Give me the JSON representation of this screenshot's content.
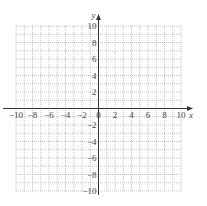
{
  "chart_data": {
    "type": "scatter",
    "title": "",
    "xlabel": "x",
    "ylabel": "y",
    "xlim": [
      -10,
      10
    ],
    "ylim": [
      -10,
      10
    ],
    "grid": true,
    "grid_step": 1,
    "x_ticks": [
      -10,
      -8,
      -6,
      -4,
      -2,
      0,
      2,
      4,
      6,
      8,
      10
    ],
    "y_ticks": [
      -10,
      -8,
      -6,
      -4,
      -2,
      2,
      4,
      6,
      8,
      10
    ],
    "x_tick_labels": [
      "−10",
      "−8",
      "−6",
      "−4",
      "−2",
      "0",
      "2",
      "4",
      "6",
      "8",
      "10"
    ],
    "y_tick_labels": [
      "−10",
      "−8",
      "−6",
      "−4",
      "−2",
      "2",
      "4",
      "6",
      "8",
      "10"
    ],
    "series": []
  },
  "colors": {
    "grid": "#9a9a9a",
    "axis": "#333333",
    "text": "#444444"
  }
}
